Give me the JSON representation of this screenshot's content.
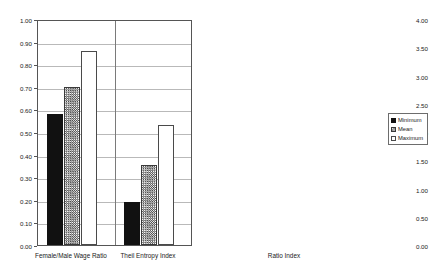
{
  "chart_data": [
    {
      "id": "left",
      "type": "bar",
      "title": "",
      "xlabel": "",
      "ylabel": "",
      "ylim": [
        0.0,
        1.0
      ],
      "ytick_step": 0.1,
      "grid": true,
      "legend_position": "none",
      "categories": [
        "Female/Male Wage Ratio",
        "Theil Entropy Index"
      ],
      "ytick_labels": [
        "0.00",
        "0.10",
        "0.20",
        "0.30",
        "0.40",
        "0.50",
        "0.60",
        "0.70",
        "0.80",
        "0.90",
        "1.00"
      ],
      "series": [
        {
          "name": "Minimum",
          "values": [
            0.58,
            0.19
          ],
          "color": "#111111",
          "fill": "solid"
        },
        {
          "name": "Mean",
          "values": [
            0.7,
            0.355
          ],
          "color": "#4a4a4a",
          "fill": "hatched"
        },
        {
          "name": "Maximum",
          "values": [
            0.86,
            0.53
          ],
          "color": "#ffffff",
          "fill": "open"
        }
      ]
    },
    {
      "id": "right",
      "type": "bar",
      "title": "",
      "xlabel": "",
      "ylabel": "",
      "ylim": [
        0.0,
        4.0
      ],
      "ytick_step": 0.5,
      "grid": true,
      "legend_position": "right",
      "categories": [
        "Ratio Index"
      ],
      "ytick_labels": [
        "0.00",
        "0.50",
        "1.00",
        "1.50",
        "2.00",
        "2.50",
        "3.00",
        "3.50",
        "4.00"
      ],
      "series": [
        {
          "name": "Minimum",
          "values": [
            1.08
          ],
          "color": "#111111",
          "fill": "solid"
        },
        {
          "name": "Mean",
          "values": [
            2.38
          ],
          "color": "#4a4a4a",
          "fill": "hatched"
        },
        {
          "name": "Maximum",
          "values": [
            3.78
          ],
          "color": "#ffffff",
          "fill": "open"
        }
      ]
    }
  ],
  "legend": {
    "items": [
      {
        "label": "Minimum"
      },
      {
        "label": "Mean"
      },
      {
        "label": "Maximum"
      }
    ]
  },
  "colors": {
    "minimum": "#111111",
    "mean": "#4a4a4a",
    "maximum": "#ffffff",
    "axis": "#555555",
    "gridline": "#b9b9b9",
    "background": "#ffffff"
  }
}
